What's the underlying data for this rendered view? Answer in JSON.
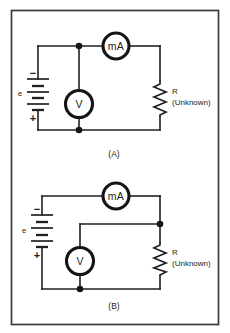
{
  "figure": {
    "colors": {
      "ink": "#231f20",
      "meter_stroke": "#151515",
      "frame": "#3a3a3a",
      "background": "#ffffff"
    },
    "circuits": [
      {
        "id": "circuit-a",
        "caption": "(A)",
        "source": {
          "label": "e",
          "positive_sign": "+",
          "negative_sign": "−",
          "type": "battery"
        },
        "ammeter": {
          "label": "mA",
          "type": "milliammeter"
        },
        "voltmeter": {
          "label": "V",
          "type": "voltmeter"
        },
        "resistor": {
          "label": "R",
          "sublabel": "(Unknown)",
          "type": "resistor"
        },
        "notes": "Voltmeter connected across the source, ammeter in series before the resistor"
      },
      {
        "id": "circuit-b",
        "caption": "(B)",
        "source": {
          "label": "e",
          "positive_sign": "+",
          "negative_sign": "−",
          "type": "battery"
        },
        "ammeter": {
          "label": "mA",
          "type": "milliammeter"
        },
        "voltmeter": {
          "label": "V",
          "type": "voltmeter"
        },
        "resistor": {
          "label": "R",
          "sublabel": "(Unknown)",
          "type": "resistor"
        },
        "notes": "Voltmeter connected across the unknown resistor, ammeter in series with the source"
      }
    ]
  }
}
